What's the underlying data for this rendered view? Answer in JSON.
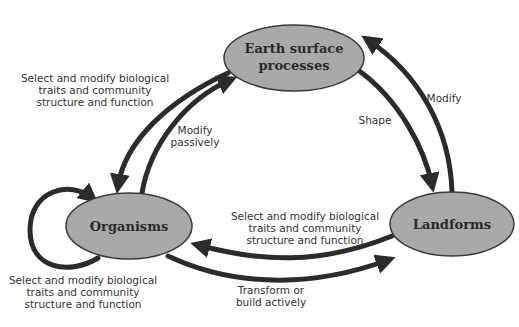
{
  "nodes": {
    "earth": {
      "line1": "Earth surface",
      "line2": "processes"
    },
    "organisms": {
      "label": "Organisms"
    },
    "landforms": {
      "label": "Landforms"
    }
  },
  "edge_labels": {
    "top_left": [
      "Select and modify biological",
      "traits and community",
      "structure and function"
    ],
    "modify_passively": [
      "Modify",
      "passively"
    ],
    "shape": [
      "Shape"
    ],
    "modify": [
      "Modify"
    ],
    "middle": [
      "Select and modify biological",
      "traits and community",
      "structure and function"
    ],
    "self_loop": [
      "Select and modify biological",
      "traits and community",
      "structure and function"
    ],
    "transform": [
      "Transform or",
      "build actively"
    ]
  },
  "colors": {
    "node_fill": "#a9a9a9",
    "node_stroke": "#3a3a3a",
    "arrow": "#2b2b2b",
    "text": "#333333"
  }
}
